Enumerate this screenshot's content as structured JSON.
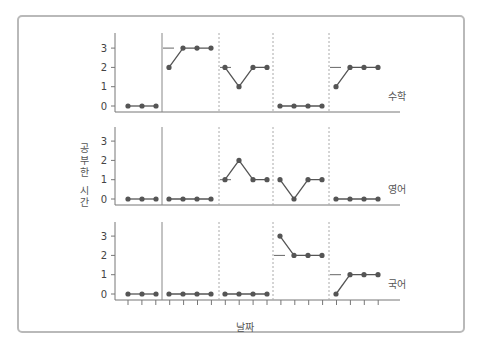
{
  "chart_data": {
    "type": "line",
    "title": "",
    "xlabel": "날짜",
    "ylabel": "공부한 시간",
    "ylim": [
      0,
      3
    ],
    "yticks": [
      0,
      1,
      2,
      3
    ],
    "grid": false,
    "phase_sessions": [
      3,
      4,
      4,
      4,
      4
    ],
    "phase_lines": [
      "solid",
      "dotted",
      "dotted",
      "dotted"
    ],
    "panels": [
      {
        "name": "수학",
        "phases": [
          [
            0,
            0,
            0
          ],
          [
            2,
            3,
            3,
            3
          ],
          [
            2,
            1,
            2,
            2
          ],
          [
            0,
            0,
            0,
            0
          ],
          [
            1,
            2,
            2,
            2
          ]
        ],
        "criteria": [
          null,
          3,
          2,
          null,
          2
        ]
      },
      {
        "name": "영어",
        "phases": [
          [
            0,
            0,
            0
          ],
          [
            0,
            0,
            0,
            0
          ],
          [
            1,
            2,
            1,
            1
          ],
          [
            1,
            0,
            1,
            1
          ],
          [
            0,
            0,
            0,
            0
          ]
        ],
        "criteria": [
          null,
          null,
          1,
          null,
          null
        ]
      },
      {
        "name": "국어",
        "phases": [
          [
            0,
            0,
            0
          ],
          [
            0,
            0,
            0,
            0
          ],
          [
            0,
            0,
            0,
            0
          ],
          [
            3,
            2,
            2,
            2
          ],
          [
            0,
            1,
            1,
            1
          ]
        ],
        "criteria": [
          null,
          null,
          null,
          2,
          1
        ]
      }
    ]
  },
  "labels": {
    "ylabel_chars": [
      "공",
      "부",
      "한",
      "시",
      "간"
    ],
    "xlabel": "날짜"
  },
  "colors": {
    "line": "#555555",
    "point": "#555555",
    "axis": "#777777",
    "frame": "#b9b9b9"
  }
}
